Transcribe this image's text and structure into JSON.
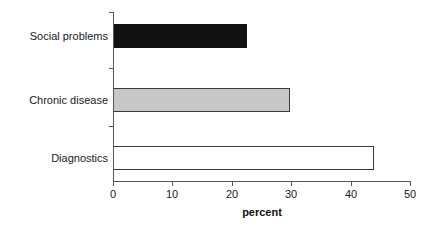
{
  "chart_data": {
    "type": "bar",
    "orientation": "horizontal",
    "title": "",
    "subtitle": "",
    "xlabel": "percent",
    "ylabel": "",
    "categories": [
      "Diagnostics",
      "Chronic disease",
      "Social problems"
    ],
    "values": [
      44,
      29.8,
      22.5
    ],
    "xlim": [
      0,
      50
    ],
    "xticks": [
      0,
      10,
      20,
      30,
      40,
      50
    ],
    "xticklabels": [
      "0",
      "10",
      "20",
      "30",
      "40",
      "50"
    ],
    "grid": false,
    "legend": null,
    "annotations": [],
    "series": [
      {
        "name": "percent",
        "points": [
          {
            "category": "Diagnostics",
            "value": 44,
            "fill": "#ffffff",
            "stroke": "#3a3a3a"
          },
          {
            "category": "Chronic disease",
            "value": 29.8,
            "fill": "#c8c8c8",
            "stroke": "#3a3a3a"
          },
          {
            "category": "Social problems",
            "value": 22.5,
            "fill": "#111111",
            "stroke": "#111111"
          }
        ]
      }
    ]
  },
  "axis": {
    "x_title": "percent",
    "tick_0": "0",
    "tick_1": "10",
    "tick_2": "20",
    "tick_3": "30",
    "tick_4": "40",
    "tick_5": "50"
  },
  "categories": {
    "social_problems": "Social problems",
    "chronic_disease": "Chronic disease",
    "diagnostics": "Diagnostics"
  },
  "colors": {
    "bar_social_problems": "#111111",
    "bar_chronic_disease": "#c8c8c8",
    "bar_diagnostics": "#ffffff",
    "bar_stroke": "#3a3a3a",
    "axis": "#555555",
    "text": "#1a1a1a",
    "background": "#ffffff"
  }
}
